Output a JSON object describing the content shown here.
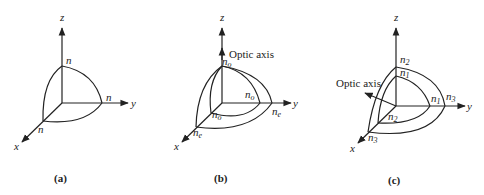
{
  "panels": [
    {
      "caption": "(a)",
      "axes": {
        "x": "x",
        "y": "y",
        "z": "z"
      },
      "labels": {
        "z_int": "n",
        "y_int": "n",
        "x_int": "n"
      }
    },
    {
      "caption": "(b)",
      "axes": {
        "x": "x",
        "y": "y",
        "z": "z"
      },
      "optic_axis_label": "Optic axis",
      "labels": {
        "z_int": {
          "base": "n",
          "sub": "o"
        },
        "y_inner": {
          "base": "n",
          "sub": "o"
        },
        "y_outer": {
          "base": "n",
          "sub": "e"
        },
        "x_inner": {
          "base": "n",
          "sub": "o"
        },
        "x_outer": {
          "base": "n",
          "sub": "e"
        }
      }
    },
    {
      "caption": "(c)",
      "axes": {
        "x": "x",
        "y": "y",
        "z": "z"
      },
      "optic_axis_label": "Optic axis",
      "labels": {
        "z_outer": {
          "base": "n",
          "sub": "2"
        },
        "z_inner": {
          "base": "n",
          "sub": "1"
        },
        "y_inner": {
          "base": "n",
          "sub": "1"
        },
        "y_outer": {
          "base": "n",
          "sub": "3"
        },
        "x_inner": {
          "base": "n",
          "sub": "2"
        },
        "x_outer": {
          "base": "n",
          "sub": "3"
        }
      }
    }
  ]
}
